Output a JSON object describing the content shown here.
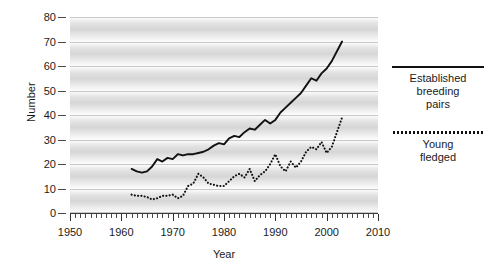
{
  "chart_data": {
    "type": "line",
    "title": "",
    "xlabel": "Year",
    "ylabel": "Number",
    "xlim": [
      1950,
      2010
    ],
    "ylim": [
      0,
      80
    ],
    "ytick_step": 10,
    "xtick_step": 10,
    "xminor_step": 1,
    "grid": "horizontal-bands",
    "legend_position": "right",
    "ytick_labels": [
      "0",
      "10",
      "20",
      "30",
      "40",
      "50",
      "60",
      "70",
      "80"
    ],
    "ytick_values": [
      0,
      10,
      20,
      30,
      40,
      50,
      60,
      70,
      80
    ],
    "xtick_labels": [
      "1950",
      "1960",
      "1970",
      "1980",
      "1990",
      "2000",
      "2010"
    ],
    "xtick_values": [
      1950,
      1960,
      1970,
      1980,
      1990,
      2000,
      2010
    ],
    "series": [
      {
        "name": "Established breeding pairs",
        "style": "solid",
        "color": "#111111",
        "x": [
          1962,
          1963,
          1964,
          1965,
          1966,
          1967,
          1968,
          1969,
          1970,
          1971,
          1972,
          1973,
          1974,
          1975,
          1976,
          1977,
          1978,
          1979,
          1980,
          1981,
          1982,
          1983,
          1984,
          1985,
          1986,
          1987,
          1988,
          1989,
          1990,
          1991,
          1992,
          1993,
          1994,
          1995,
          1996,
          1997,
          1998,
          1999,
          2000,
          2001,
          2002,
          2003
        ],
        "values": [
          18,
          17,
          16.5,
          17,
          19,
          22,
          21,
          22.5,
          22,
          24,
          23.5,
          24,
          24,
          24.5,
          25,
          26,
          27.5,
          28.5,
          28,
          30.5,
          31.5,
          31,
          33,
          34.5,
          34,
          36,
          38,
          36.5,
          38,
          41,
          43,
          45,
          47,
          49,
          52,
          55,
          54,
          57,
          59,
          62,
          66,
          70
        ]
      },
      {
        "name": "Young fledged",
        "style": "dotted",
        "color": "#111111",
        "x": [
          1962,
          1963,
          1964,
          1965,
          1966,
          1967,
          1968,
          1969,
          1970,
          1971,
          1972,
          1973,
          1974,
          1975,
          1976,
          1977,
          1978,
          1979,
          1980,
          1981,
          1982,
          1983,
          1984,
          1985,
          1986,
          1987,
          1988,
          1989,
          1990,
          1991,
          1992,
          1993,
          1994,
          1995,
          1996,
          1997,
          1998,
          1999,
          2000,
          2001,
          2002,
          2003
        ],
        "values": [
          7.5,
          7,
          7,
          6.5,
          5.5,
          6,
          7,
          7,
          7.5,
          6,
          7,
          11,
          12,
          16,
          14.5,
          12,
          11.5,
          11,
          11,
          13,
          15,
          16,
          14.5,
          18,
          13,
          15.5,
          17,
          20,
          24,
          19,
          17,
          21,
          18.5,
          21,
          25,
          27,
          26,
          29,
          24.5,
          27,
          33,
          39
        ]
      }
    ]
  },
  "legend": {
    "entries": [
      {
        "label_line1": "Established",
        "label_line2": "breeding",
        "label_line3": "pairs",
        "style": "solid"
      },
      {
        "label_line1": "Young",
        "label_line2": "fledged",
        "label_line3": "",
        "style": "dotted"
      }
    ]
  }
}
